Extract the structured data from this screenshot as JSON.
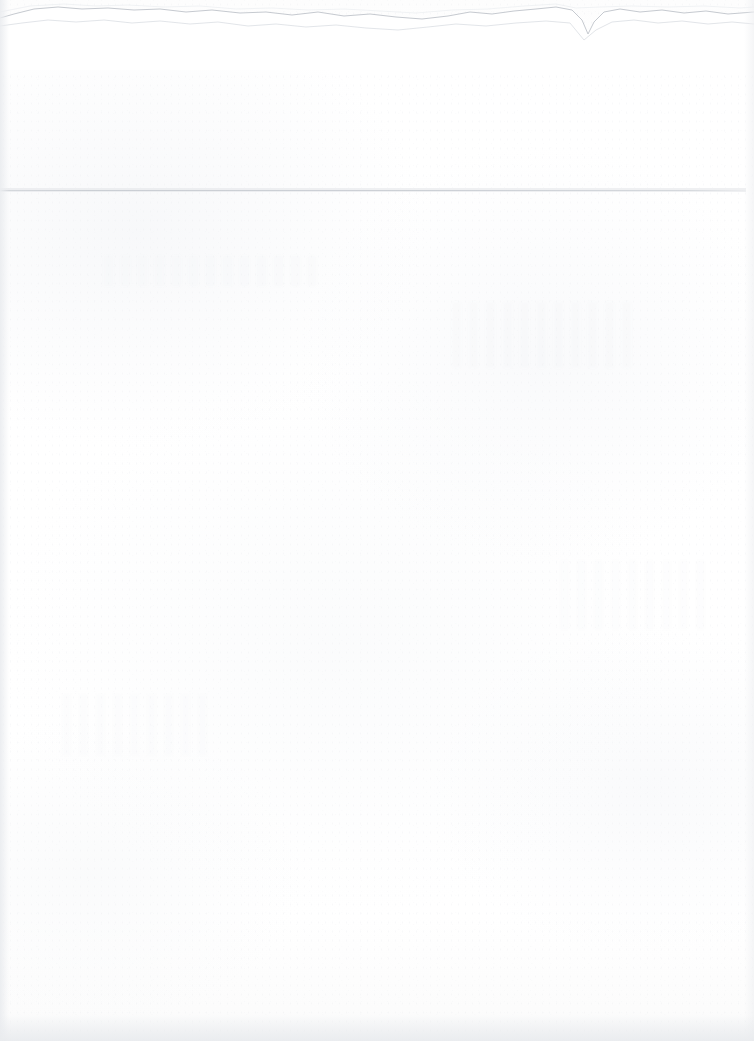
{
  "document": {
    "kind": "scanned-blank-page",
    "width": 754,
    "height": 1041,
    "caption": "",
    "body_text": "",
    "header_text": "",
    "footer_text": "",
    "page_number": ""
  },
  "colors": {
    "page_background": "#fefefe",
    "paper_tone": "#fdfdfd",
    "rule_line": "#c9cdd3",
    "torn_edge": "#c6cad0",
    "edge_shadow": "#ebedf0",
    "speckle": "#e8eaed"
  },
  "features": {
    "torn_top_edge": {
      "name": "torn-top-edge",
      "label": "",
      "y_range": [
        4,
        58
      ],
      "notch_x": 585
    },
    "rule_line": {
      "name": "horizontal-rule",
      "label": "",
      "y": 190,
      "x_start": 0,
      "x_end": 746
    },
    "left_edge_shadow": {
      "name": "left-edge-shadow",
      "label": "",
      "x_range": [
        0,
        9
      ]
    },
    "right_edge_shadow": {
      "name": "right-edge-shadow",
      "label": "",
      "x_range": [
        744,
        754
      ]
    },
    "bottom_edge_shadow": {
      "name": "bottom-edge-shadow",
      "label": "",
      "y_range": [
        1015,
        1041
      ]
    }
  },
  "annotations": {
    "visible_text_count": 0,
    "note": ""
  }
}
